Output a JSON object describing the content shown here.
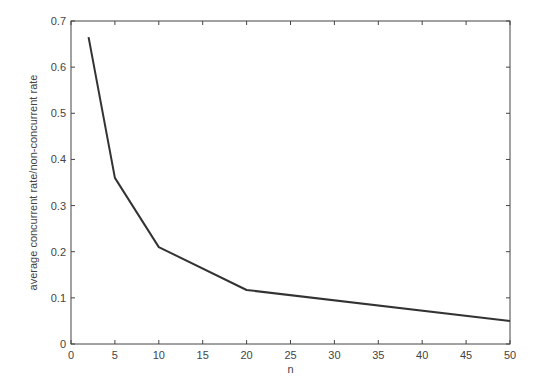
{
  "chart_data": {
    "type": "line",
    "title": "",
    "xlabel": "n",
    "ylabel": "average concurrent rate/non-concurrent rate",
    "xlim": [
      0,
      50
    ],
    "ylim": [
      0,
      0.7
    ],
    "xticks": [
      0,
      5,
      10,
      15,
      20,
      25,
      30,
      35,
      40,
      45,
      50
    ],
    "yticks": [
      0,
      0.1,
      0.2,
      0.3,
      0.4,
      0.5,
      0.6,
      0.7
    ],
    "grid": false,
    "legend": null,
    "series": [
      {
        "name": "ratio",
        "color": "#333333",
        "x": [
          2,
          5,
          10,
          20,
          50
        ],
        "y": [
          0.665,
          0.36,
          0.21,
          0.117,
          0.05
        ]
      }
    ]
  }
}
